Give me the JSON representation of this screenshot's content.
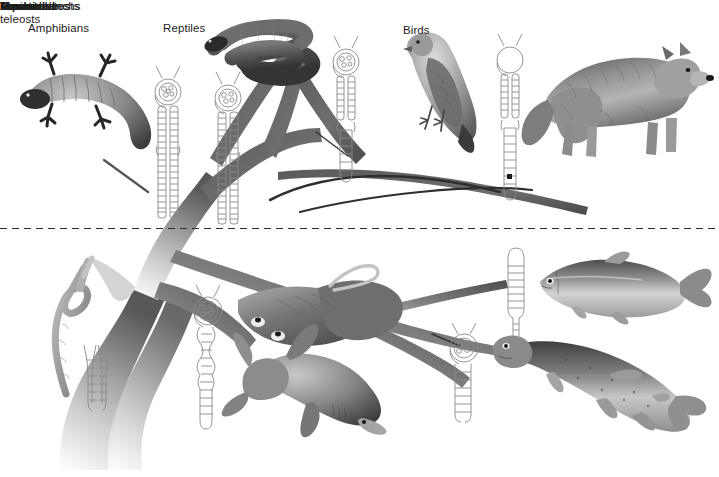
{
  "figure": {
    "domain": "diagram",
    "kind": "phylogenetic-tree-diagram",
    "background_color": "#ffffff",
    "width": 719,
    "height": 477
  },
  "divider": {
    "style": "dashed",
    "color": "#2b2b2b",
    "above_label": "Terrestrial",
    "below_label": "Aquatic",
    "y": 228
  },
  "labels": {
    "amphibians": "Amphibians",
    "reptiles": "Reptiles",
    "birds": "Birds",
    "mammals": "Mammals",
    "prochordates": "Prochordates",
    "elasmobranchs": "Elasmobranchs",
    "marine_teleosts": "Marine teleosts",
    "freshwater_teleosts": "Freshwater\nteleosts",
    "terrestrial": "Terrestrial",
    "aquatic": "Aquatic"
  },
  "colors": {
    "tree_dark": "#4a4a4a",
    "tree_mid": "#8d8d8d",
    "tree_light": "#d8d8d8",
    "tree_fade": "#f2f2f2",
    "nephron_outline": "#8a8a8a",
    "text": "#1c1c1c",
    "animal_dark": "#2e2e2e",
    "animal_mid": "#7c7c7c",
    "animal_light": "#b9b9b9"
  },
  "groups": [
    {
      "id": "prochordates",
      "label": "Prochordates",
      "habitat": "Aquatic",
      "nephron": {
        "type": "nephridium",
        "glomerulus": false,
        "shape": "short forked segmented tubule (Y-shaped)",
        "segments": 8
      },
      "animal": "amphioxus / lancelet (worm-like prochordate)"
    },
    {
      "id": "elasmobranchs",
      "label": "Elasmobranchs",
      "habitat": "Aquatic",
      "nephron": {
        "type": "glomerular nephron",
        "glomerulus": true,
        "shape": "large glomerulus with long coiled convoluted tubule and loop",
        "segments": 34
      },
      "animal": "shark and ray (skate)"
    },
    {
      "id": "marine-teleosts",
      "label": "Marine teleosts",
      "habitat": "Aquatic",
      "nephron": {
        "type": "aglomerular nephron",
        "glomerulus": false,
        "shape": "short simple hairpin tubule with no renal corpuscle",
        "segments": 18
      },
      "animal": "marine bony fish (herring-like teleost)"
    },
    {
      "id": "freshwater-teleosts",
      "label": "Freshwater teleosts",
      "habitat": "Aquatic",
      "nephron": {
        "type": "glomerular nephron",
        "glomerulus": true,
        "shape": "large glomerulus with moderate hairpin tubule",
        "segments": 22
      },
      "animal": "freshwater bony fish (trout / pike)"
    },
    {
      "id": "amphibians",
      "label": "Amphibians",
      "habitat": "Terrestrial",
      "nephron": {
        "type": "glomerular nephron",
        "glomerulus": true,
        "shape": "glomerulus with long straight segmented tubule, no loop of Henle",
        "segments": 30
      },
      "animal": "salamander / newt"
    },
    {
      "id": "reptiles",
      "label": "Reptiles",
      "habitat": "Terrestrial",
      "nephron": {
        "type": "glomerular nephron",
        "glomerulus": true,
        "shape": "glomerulus with long straight segmented tubule, no loop of Henle",
        "segments": 30
      },
      "animal": "snake"
    },
    {
      "id": "birds",
      "label": "Birds",
      "habitat": "Terrestrial",
      "nephron": {
        "type": "glomerular nephron with short loop of Henle",
        "glomerulus": true,
        "shape": "glomerulus with tubule and short loop of Henle",
        "segments": 32
      },
      "animal": "perching bird (finch / sparrow)"
    },
    {
      "id": "mammals",
      "label": "Mammals",
      "habitat": "Terrestrial",
      "nephron": {
        "type": "glomerular nephron with long loop of Henle",
        "glomerulus": true,
        "shape": "glomerulus with long descending/ascending loop of Henle",
        "segments": 30
      },
      "animal": "wolf"
    }
  ],
  "tree": {
    "description": "Branching evolutionary tree, trunk rising from bottom-left fading pale, branches darkening toward the tips",
    "root": "bottom-left base (prochordates)",
    "tips": [
      "amphibians",
      "reptiles",
      "birds",
      "mammals",
      "marine-teleosts",
      "freshwater-teleosts",
      "elasmobranchs"
    ]
  }
}
